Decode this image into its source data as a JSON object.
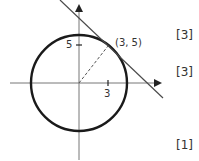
{
  "diagram": {
    "point_label": "(3, 5)",
    "tick_y_label": "5",
    "tick_x_label": "3"
  },
  "marks": [
    {
      "label": "[3]"
    },
    {
      "label": "[3]"
    },
    {
      "label": "[1]"
    }
  ],
  "colors": {
    "circle": "#1a1a1a",
    "axes": "#6e6e6e",
    "tangent": "#4a4a4a",
    "text": "#333333"
  }
}
